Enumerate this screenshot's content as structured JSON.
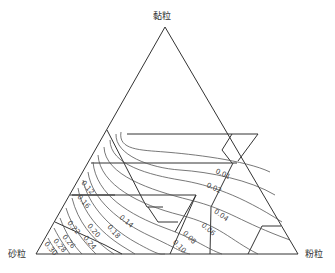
{
  "diagram": {
    "type": "ternary",
    "vertices": {
      "top": {
        "label": "黏粒",
        "x": 165,
        "y": 27
      },
      "left": {
        "label": "砂粒",
        "x": 36,
        "y": 254
      },
      "right": {
        "label": "粉粒",
        "x": 298,
        "y": 254
      }
    },
    "contour_labels": [
      {
        "text": "0.01",
        "x": 222,
        "y": 176,
        "rot": 25
      },
      {
        "text": "0.02",
        "x": 213,
        "y": 190,
        "rot": 25
      },
      {
        "text": "0.04",
        "x": 220,
        "y": 217,
        "rot": 35
      },
      {
        "text": "0.06",
        "x": 207,
        "y": 231,
        "rot": 40
      },
      {
        "text": "0.08",
        "x": 188,
        "y": 239,
        "rot": 45
      },
      {
        "text": "0.10",
        "x": 178,
        "y": 248,
        "rot": 45
      },
      {
        "text": "0.12",
        "x": 86,
        "y": 189,
        "rot": 50
      },
      {
        "text": "0.14",
        "x": 125,
        "y": 223,
        "rot": 40
      },
      {
        "text": "0.16",
        "x": 82,
        "y": 203,
        "rot": 50
      },
      {
        "text": "0.18",
        "x": 112,
        "y": 233,
        "rot": 50
      },
      {
        "text": "0.20",
        "x": 92,
        "y": 232,
        "rot": 50
      },
      {
        "text": "0.22",
        "x": 72,
        "y": 229,
        "rot": 50
      },
      {
        "text": "0.24",
        "x": 88,
        "y": 244,
        "rot": 50
      },
      {
        "text": "0.26",
        "x": 67,
        "y": 243,
        "rot": 50
      },
      {
        "text": "0.28",
        "x": 58,
        "y": 247,
        "rot": 50
      },
      {
        "text": "0.30",
        "x": 49,
        "y": 250,
        "rot": 50
      }
    ]
  }
}
